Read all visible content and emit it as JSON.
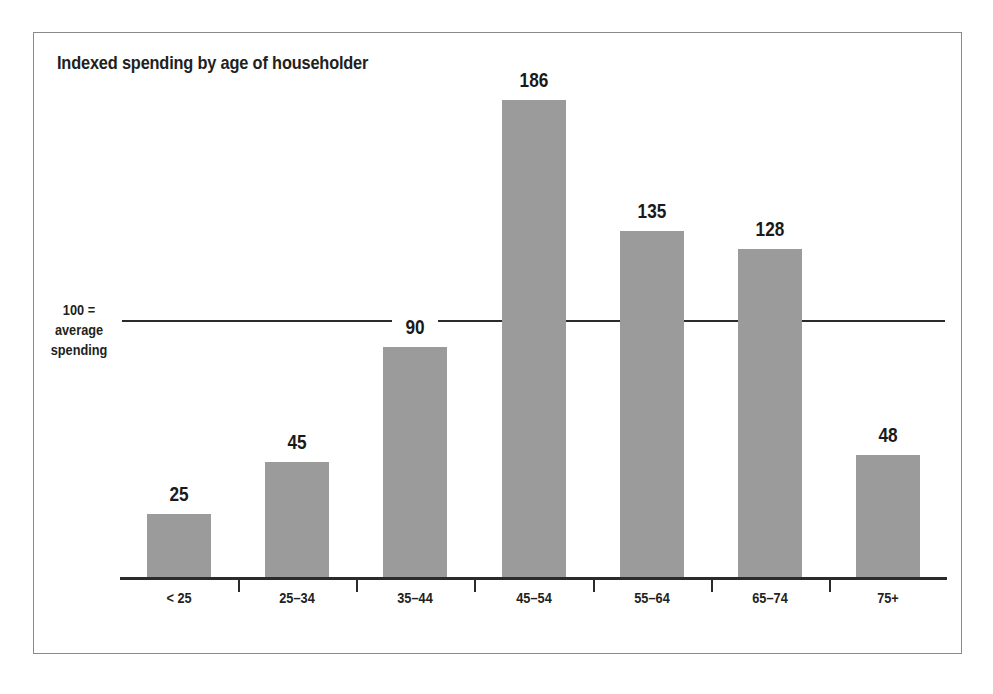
{
  "figure": {
    "title": "Indexed spending by age of householder",
    "reference_label_lines": [
      "100 =",
      "average",
      "spending"
    ],
    "bar_color": "#9b9b9b",
    "axis_color": "#2b2b2b",
    "frame_color": "#8a8a8a",
    "background": "#ffffff"
  },
  "chart_data": {
    "type": "bar",
    "title": "Indexed spending by age of householder",
    "xlabel": "",
    "ylabel": "",
    "categories": [
      "< 25",
      "25–34",
      "35–44",
      "45–54",
      "55–64",
      "65–74",
      "75+"
    ],
    "values": [
      25,
      45,
      90,
      186,
      135,
      128,
      48
    ],
    "value_labels": [
      "25",
      "45",
      "90",
      "186",
      "135",
      "128",
      "48"
    ],
    "reference_line": {
      "value": 100,
      "label": "100 = average spending"
    },
    "ylim": [
      0,
      200
    ],
    "grid": false,
    "legend": null
  }
}
